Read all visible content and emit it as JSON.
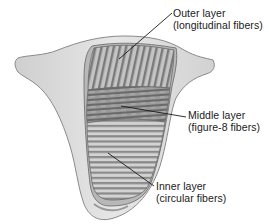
{
  "figure": {
    "labels": [
      {
        "id": "outer",
        "title": "Outer layer",
        "detail": "(longitudinal fibers)"
      },
      {
        "id": "middle",
        "title": "Middle layer",
        "detail": "(figure-8 fibers)"
      },
      {
        "id": "inner",
        "title": "Inner layer",
        "detail": "(circular fibers)"
      }
    ],
    "colors": {
      "background": "#ffffff",
      "body_fill": "#dcdcdc",
      "body_stroke": "#8a8a8a",
      "fiber_dark": "#6f6f6f",
      "fiber_light": "#bdbdbd",
      "leader_line": "#1a1a1a",
      "text": "#1a1a1a"
    }
  }
}
